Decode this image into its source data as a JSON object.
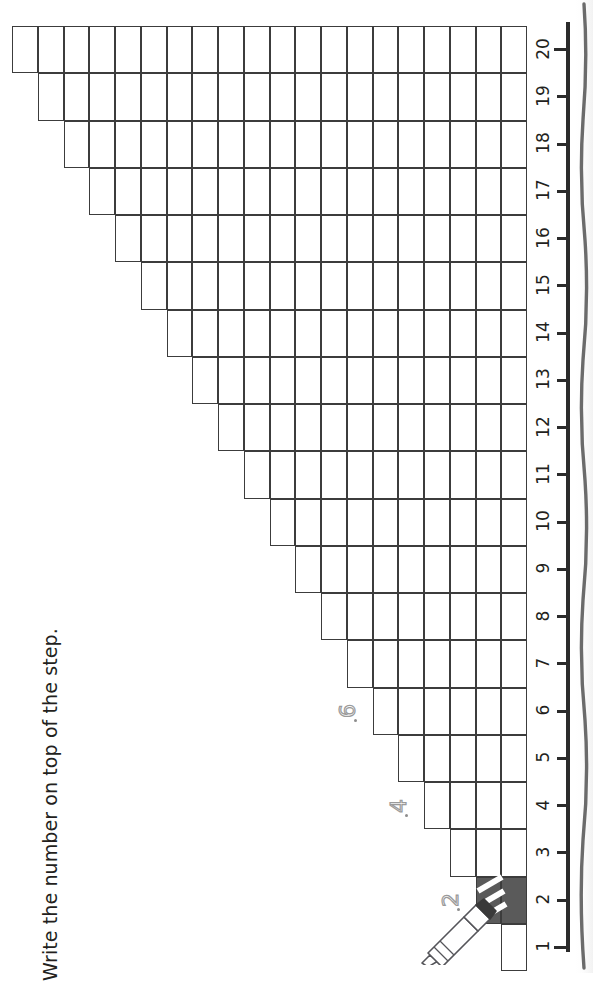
{
  "page": {
    "background_color": "#ffffff",
    "ink_color": "#231f20",
    "grid_line_color": "#3c3c3c",
    "shaded_step_color": "#5a5a5a"
  },
  "instruction": {
    "text": "Write the number on top of the step.",
    "orientation": "rotated-90-ccw"
  },
  "chart_data": {
    "type": "bar",
    "title": "Write the number on top of the step.",
    "xlabel": "",
    "ylabel": "",
    "orientation": "horizontal-staircase",
    "categories": [
      1,
      2,
      3,
      4,
      5,
      6,
      7,
      8,
      9,
      10,
      11,
      12,
      13,
      14,
      15,
      16,
      17,
      18,
      19,
      20
    ],
    "values": [
      1,
      2,
      3,
      4,
      5,
      6,
      7,
      8,
      9,
      10,
      11,
      12,
      13,
      14,
      15,
      16,
      17,
      18,
      19,
      20
    ],
    "xlim": [
      1,
      20
    ],
    "grid": true,
    "legend": false,
    "note": "Each step n is a row of n unit squares; step 2 is shaded dark."
  },
  "number_line": {
    "ticks": [
      "1",
      "2",
      "3",
      "4",
      "5",
      "6",
      "7",
      "8",
      "9",
      "10",
      "11",
      "12",
      "13",
      "14",
      "15",
      "16",
      "17",
      "18",
      "19",
      "20"
    ],
    "min": "1",
    "max": "20",
    "line_color": "#2b2b2b"
  },
  "shaded_step": {
    "step_number": "2",
    "square_count": "2",
    "color": "#5a5a5a"
  },
  "traces": [
    {
      "value": "2",
      "step": "2"
    },
    {
      "value": "4",
      "step": "4"
    },
    {
      "value": "6",
      "step": "6"
    }
  ],
  "pencil": {
    "label": "pencil-illustration",
    "body_color": "#ffffff",
    "outline_color": "#55555a",
    "tip_color": "#3a3a3a"
  },
  "spine": {
    "label": "book-spine-edge",
    "color": "#6b6b6b"
  }
}
